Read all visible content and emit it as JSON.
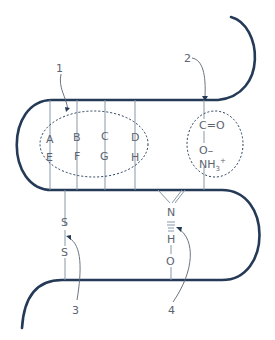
{
  "diagram": {
    "colors": {
      "strand": "#243a57",
      "side_chain": "#8797a8",
      "text": "#5c6470"
    },
    "callouts": [
      {
        "number": "1",
        "target": "hydrophobic interactions region"
      },
      {
        "number": "2",
        "target": "ionic bond"
      },
      {
        "number": "3",
        "target": "disulfide bridge"
      },
      {
        "number": "4",
        "target": "hydrogen bond"
      }
    ],
    "hydrophobic_group": {
      "top_row": [
        "A",
        "B",
        "C",
        "D"
      ],
      "bottom_row": [
        "E",
        "F",
        "G",
        "H"
      ]
    },
    "ionic_group": {
      "carbonyl": "C=O",
      "oxide": "O–",
      "ammonium": "NH",
      "ammonium_sub": "3",
      "ammonium_sup": "+"
    },
    "disulfide": {
      "atom1": "S",
      "atom2": "S"
    },
    "hydrogen_bond": {
      "n": "N",
      "h": "H",
      "o": "O"
    }
  }
}
